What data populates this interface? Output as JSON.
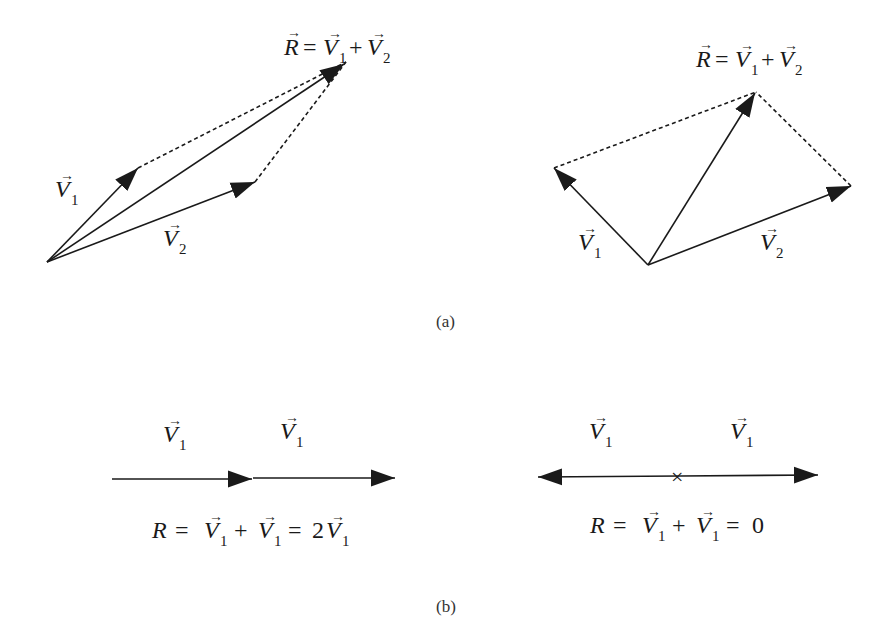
{
  "figure": {
    "panel_a": {
      "caption": "(a)",
      "left_diagram": {
        "equation": {
          "lhs": "R",
          "rhs1": "V",
          "sub1": "1",
          "op": "+",
          "rhs2": "V",
          "sub2": "2"
        },
        "label_v1": {
          "sym": "V",
          "sub": "1"
        },
        "label_v2": {
          "sym": "V",
          "sub": "2"
        },
        "origin": [
          47,
          262
        ],
        "v1_tip": [
          138,
          168
        ],
        "v2_tip": [
          255,
          182
        ],
        "r_tip": [
          346,
          62
        ]
      },
      "right_diagram": {
        "equation": {
          "lhs": "R",
          "rhs1": "V",
          "sub1": "1",
          "op": "+",
          "rhs2": "V",
          "sub2": "2"
        },
        "label_v1": {
          "sym": "V",
          "sub": "1"
        },
        "label_v2": {
          "sym": "V",
          "sub": "2"
        },
        "origin": [
          648,
          265
        ],
        "v1_tip": [
          554,
          168
        ],
        "v2_tip": [
          851,
          186
        ],
        "r_tip": [
          756,
          92
        ]
      }
    },
    "panel_b": {
      "caption": "(b)",
      "left_diagram": {
        "label_a": {
          "sym": "V",
          "sub": "1"
        },
        "label_b": {
          "sym": "V",
          "sub": "1"
        },
        "equation": {
          "lhs": "R",
          "eq": "=",
          "t1": "V",
          "s1": "1",
          "op": "+",
          "t2": "V",
          "s2": "1",
          "eq2": "=",
          "coef": "2",
          "t3": "V",
          "s3": "1"
        }
      },
      "right_diagram": {
        "label_a": {
          "sym": "V",
          "sub": "1"
        },
        "label_b": {
          "sym": "V",
          "sub": "1"
        },
        "center_mark": "×",
        "equation": {
          "lhs": "R",
          "eq": "=",
          "t1": "V",
          "s1": "1",
          "op": "+",
          "t2": "V",
          "s2": "1",
          "eq2": "=",
          "result": "0"
        }
      }
    },
    "colors": {
      "ink": "#1a1a1a",
      "background": "#ffffff"
    }
  }
}
